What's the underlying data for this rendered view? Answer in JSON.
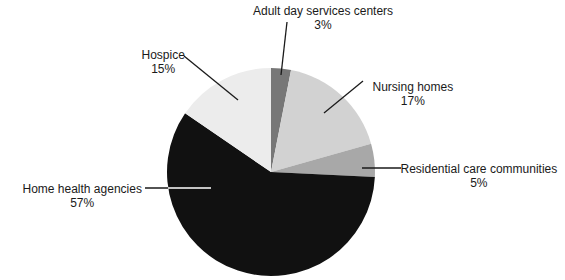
{
  "chart_data": {
    "type": "pie",
    "title": "",
    "start_angle_deg": 0,
    "direction": "clockwise",
    "center": [
      271,
      172
    ],
    "radius": 104,
    "slices": [
      {
        "label": "Adult day services centers",
        "value": 3,
        "display": "3%",
        "color": "#777777"
      },
      {
        "label": "Nursing homes",
        "value": 17,
        "display": "17%",
        "color": "#d2d2d2"
      },
      {
        "label": "Residential care communities",
        "value": 5,
        "display": "5%",
        "color": "#a8a8a8"
      },
      {
        "label": "Home health agencies",
        "value": 57,
        "display": "57%",
        "color": "#111111"
      },
      {
        "label": "Hospice",
        "value": 15,
        "display": "15%",
        "color": "#ececec"
      }
    ]
  },
  "labels": [
    {
      "name": "label-adult-day",
      "lines": [
        "Adult day services centers",
        "3%"
      ],
      "x": 323,
      "y": 4,
      "align": "center",
      "leader": [
        [
          287,
          22
        ],
        [
          281,
          75
        ]
      ]
    },
    {
      "name": "label-nursing",
      "lines": [
        "Nursing homes",
        "17%"
      ],
      "x": 413,
      "y": 80,
      "align": "center",
      "leader": [
        [
          363,
          81
        ],
        [
          324,
          113
        ]
      ]
    },
    {
      "name": "label-residential",
      "lines": [
        "Residential care communities",
        "5%"
      ],
      "x": 479,
      "y": 162,
      "align": "center",
      "leader": [
        [
          401,
          168
        ],
        [
          362,
          168
        ]
      ]
    },
    {
      "name": "label-home-health",
      "lines": [
        "Home health agencies",
        "57%"
      ],
      "x": 82,
      "y": 182,
      "align": "center",
      "leader": [
        [
          145,
          188
        ],
        [
          211,
          188
        ]
      ]
    },
    {
      "name": "label-hospice",
      "lines": [
        "Hospice",
        "15%"
      ],
      "x": 163,
      "y": 48,
      "align": "center",
      "leader": [
        [
          184,
          56
        ],
        [
          238,
          100
        ]
      ]
    }
  ]
}
